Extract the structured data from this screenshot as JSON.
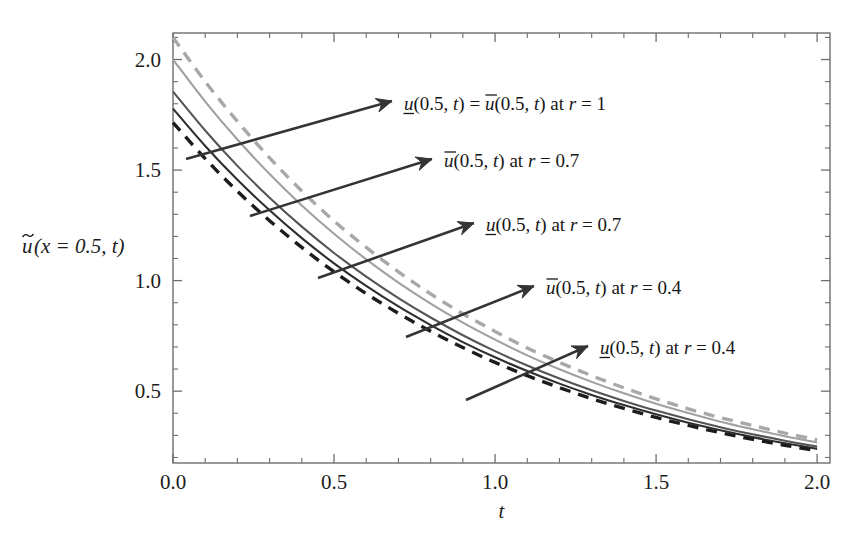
{
  "figure": {
    "background": "#ffffff",
    "frame_color": "#6e6e6e"
  },
  "axes": {
    "x_title": "t",
    "y_title_parts": {
      "u_tilde": "u",
      "rest": "(x = 0.5, t)"
    },
    "y_title_plain": "ũ(x = 0.5, t)",
    "x_ticks": [
      "0.0",
      "0.5",
      "1.0",
      "1.5",
      "2.0"
    ],
    "x_tick_values": [
      0.0,
      0.5,
      1.0,
      1.5,
      2.0
    ],
    "y_ticks": [
      "0.5",
      "1.0",
      "1.5",
      "2.0"
    ],
    "y_tick_values": [
      0.5,
      1.0,
      1.5,
      2.0
    ],
    "x_minor_count": 4,
    "y_minor_count": 4,
    "xlim": [
      0.0,
      2.04
    ],
    "ylim": [
      0.175,
      2.12
    ]
  },
  "chart_data": {
    "type": "line",
    "title": "",
    "xlabel": "t",
    "ylabel": "ũ(x = 0.5, t)",
    "xlim": [
      0.0,
      2.04
    ],
    "ylim": [
      0.175,
      2.12
    ],
    "grid": false,
    "legend": "annotations-with-arrows",
    "x": [
      0.0,
      0.1,
      0.2,
      0.3,
      0.4,
      0.5,
      0.6,
      0.7,
      0.8,
      0.9,
      1.0,
      1.1,
      1.2,
      1.3,
      1.4,
      1.5,
      1.6,
      1.7,
      1.8,
      1.9,
      2.0
    ],
    "series": [
      {
        "name": "ubar(0.5,t) at r=0.4",
        "label": "ū(0.5, t) at r = 0.4",
        "style": "dashed",
        "color": "#a8a8a8",
        "width": 3.4,
        "dash": "11,8",
        "values": [
          2.1,
          1.9,
          1.72,
          1.555,
          1.405,
          1.27,
          1.15,
          1.04,
          0.94,
          0.85,
          0.77,
          0.695,
          0.63,
          0.57,
          0.515,
          0.465,
          0.42,
          0.38,
          0.345,
          0.31,
          0.28
        ]
      },
      {
        "name": "ubar(0.5,t) at r=0.7",
        "label": "ū(0.5, t) at r = 0.7",
        "style": "solid",
        "color": "#a0a0a0",
        "width": 2.1,
        "dash": "",
        "values": [
          2.0,
          1.81,
          1.638,
          1.482,
          1.34,
          1.212,
          1.096,
          0.991,
          0.896,
          0.81,
          0.733,
          0.662,
          0.599,
          0.542,
          0.49,
          0.443,
          0.401,
          0.362,
          0.328,
          0.296,
          0.268
        ]
      },
      {
        "name": "u(0.5,t) = ubar(0.5,t) at r=1",
        "label": "ᵘ(0.5, t) = ū(0.5, t) at r = 1",
        "style": "solid",
        "color": "#555555",
        "width": 2.1,
        "dash": "",
        "values": [
          1.855,
          1.679,
          1.519,
          1.375,
          1.244,
          1.125,
          1.018,
          0.921,
          0.833,
          0.753,
          0.681,
          0.616,
          0.557,
          0.504,
          0.456,
          0.412,
          0.373,
          0.337,
          0.305,
          0.276,
          0.249
        ]
      },
      {
        "name": "u(0.5,t) at r=0.7",
        "label": "ᵘ(0.5, t) at r = 0.7",
        "style": "solid",
        "color": "#2e2e2e",
        "width": 2.1,
        "dash": "",
        "values": [
          1.778,
          1.609,
          1.456,
          1.318,
          1.192,
          1.078,
          0.976,
          0.883,
          0.799,
          0.722,
          0.653,
          0.591,
          0.534,
          0.483,
          0.437,
          0.395,
          0.357,
          0.323,
          0.292,
          0.264,
          0.239
        ]
      },
      {
        "name": "u(0.5,t) at r=0.4",
        "label": "ᵘ(0.5, t) at r = 0.4",
        "style": "dashed",
        "color": "#1c1c1c",
        "width": 3.4,
        "dash": "11,8",
        "values": [
          1.715,
          1.552,
          1.404,
          1.271,
          1.15,
          1.04,
          0.941,
          0.852,
          0.771,
          0.697,
          0.63,
          0.57,
          0.516,
          0.466,
          0.422,
          0.381,
          0.345,
          0.312,
          0.282,
          0.255,
          0.231
        ]
      }
    ]
  },
  "annotations": [
    {
      "id": "annotation-r1",
      "text": "ᵘ(0.5, t) = ū(0.5, t) at r = 1",
      "segments": [
        {
          "t": "u",
          "style": "italic-underline"
        },
        {
          "t": "(0.5, ",
          "style": "plain"
        },
        {
          "t": "t",
          "style": "italic"
        },
        {
          "t": ") = ",
          "style": "plain"
        },
        {
          "t": "u",
          "style": "italic-overline"
        },
        {
          "t": "(0.5, ",
          "style": "plain"
        },
        {
          "t": "t",
          "style": "italic"
        },
        {
          "t": ") at ",
          "style": "plain"
        },
        {
          "t": "r",
          "style": "italic"
        },
        {
          "t": " = 1",
          "style": "plain"
        }
      ],
      "text_x": 404,
      "text_y": 110,
      "arrow_from": [
        186,
        159
      ],
      "arrow_to": [
        392,
        101
      ]
    },
    {
      "id": "annotation-ubar-r07",
      "text": "ū(0.5, t) at r = 0.7",
      "segments": [
        {
          "t": "u",
          "style": "italic-overline"
        },
        {
          "t": "(0.5, ",
          "style": "plain"
        },
        {
          "t": "t",
          "style": "italic"
        },
        {
          "t": ") at ",
          "style": "plain"
        },
        {
          "t": "r",
          "style": "italic"
        },
        {
          "t": " = 0.7",
          "style": "plain"
        }
      ],
      "text_x": 444,
      "text_y": 167,
      "arrow_from": [
        250,
        216
      ],
      "arrow_to": [
        432,
        159
      ]
    },
    {
      "id": "annotation-u-r07",
      "text": "ᵘ(0.5, t) at r = 0.7",
      "segments": [
        {
          "t": "u",
          "style": "italic-underline"
        },
        {
          "t": "(0.5, ",
          "style": "plain"
        },
        {
          "t": "t",
          "style": "italic"
        },
        {
          "t": ") at ",
          "style": "plain"
        },
        {
          "t": "r",
          "style": "italic"
        },
        {
          "t": " = 0.7",
          "style": "plain"
        }
      ],
      "text_x": 486,
      "text_y": 231,
      "arrow_from": [
        318,
        278
      ],
      "arrow_to": [
        474,
        223
      ]
    },
    {
      "id": "annotation-ubar-r04",
      "text": "ū(0.5, t) at r = 0.4",
      "segments": [
        {
          "t": "u",
          "style": "italic-overline"
        },
        {
          "t": "(0.5, ",
          "style": "plain"
        },
        {
          "t": "t",
          "style": "italic"
        },
        {
          "t": ") at ",
          "style": "plain"
        },
        {
          "t": "r",
          "style": "italic"
        },
        {
          "t": " = 0.4",
          "style": "plain"
        }
      ],
      "text_x": 546,
      "text_y": 294,
      "arrow_from": [
        406,
        337
      ],
      "arrow_to": [
        534,
        286
      ]
    },
    {
      "id": "annotation-u-r04",
      "text": "ᵘ(0.5, t) at r = 0.4",
      "segments": [
        {
          "t": "u",
          "style": "italic-underline"
        },
        {
          "t": "(0.5, ",
          "style": "plain"
        },
        {
          "t": "t",
          "style": "italic"
        },
        {
          "t": ") at ",
          "style": "plain"
        },
        {
          "t": "r",
          "style": "italic"
        },
        {
          "t": " = 0.4",
          "style": "plain"
        }
      ],
      "text_x": 600,
      "text_y": 354,
      "arrow_from": [
        466,
        400
      ],
      "arrow_to": [
        588,
        346
      ]
    }
  ],
  "caption": {
    "text": ""
  }
}
